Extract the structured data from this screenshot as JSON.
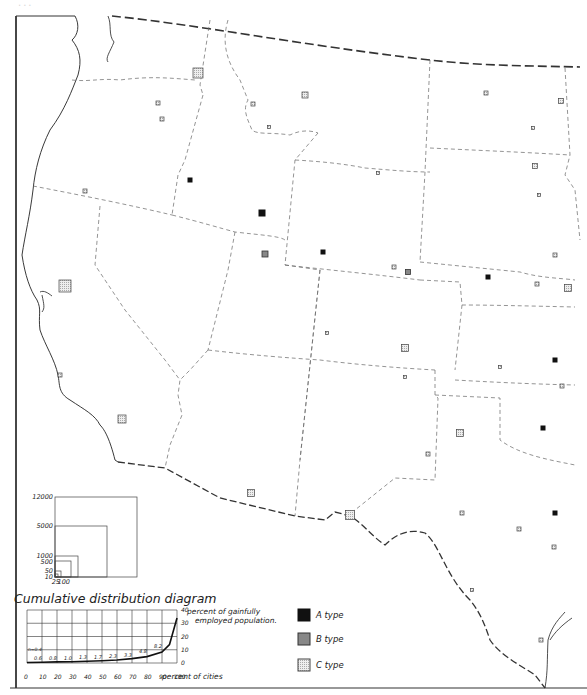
{
  "caption_partial": "...",
  "colors": {
    "ink": "#222222",
    "a_type": "#111111",
    "b_type": "#777777",
    "c_type": "#d9d9d9",
    "paper": "#ffffff"
  },
  "legend": {
    "items": [
      {
        "label": "A type",
        "fill": "#111111"
      },
      {
        "label": "B type",
        "fill": "#888888"
      },
      {
        "label": "C type",
        "fill": "#dcdcdc"
      }
    ]
  },
  "size_scale": {
    "labels_left": [
      "12000",
      "5000",
      "1000",
      "500",
      "50",
      "10"
    ],
    "labels_bottom": [
      "25",
      "100"
    ]
  },
  "chart_data": {
    "type": "line",
    "title": "Cumulative distribution diagram",
    "xlabel": "percent of cities",
    "ylabel": "percent of gainfully employed population.",
    "x_ticks": [
      "0",
      "10",
      "20",
      "30",
      "40",
      "50",
      "60",
      "70",
      "80",
      "90",
      "100"
    ],
    "y_ticks": [
      "0",
      "10",
      "20",
      "30",
      "40"
    ],
    "xlim": [
      0,
      100
    ],
    "ylim": [
      0,
      40
    ],
    "grid": true,
    "annotation": "n=0.4",
    "x": [
      0,
      10,
      20,
      30,
      40,
      50,
      60,
      70,
      80,
      90,
      95,
      100
    ],
    "values": [
      0.4,
      0.6,
      0.8,
      1.0,
      1.3,
      1.7,
      2.3,
      3.3,
      4.8,
      8.2,
      14,
      34
    ],
    "segment_labels": [
      "0.6",
      "0.8",
      "1.0",
      "1.3",
      "1.7",
      "2.3",
      "3.3",
      "4.8",
      "8.2"
    ]
  },
  "markers": [
    {
      "x": 198,
      "y": 73,
      "s": 10,
      "type": "C"
    },
    {
      "x": 158,
      "y": 103,
      "s": 4,
      "type": "C"
    },
    {
      "x": 162,
      "y": 119,
      "s": 4,
      "type": "C"
    },
    {
      "x": 253,
      "y": 104,
      "s": 4,
      "type": "C"
    },
    {
      "x": 269,
      "y": 127,
      "s": 3,
      "type": "C"
    },
    {
      "x": 305,
      "y": 95,
      "s": 6,
      "type": "C"
    },
    {
      "x": 486,
      "y": 93,
      "s": 4,
      "type": "C"
    },
    {
      "x": 561,
      "y": 101,
      "s": 5,
      "type": "C"
    },
    {
      "x": 533,
      "y": 128,
      "s": 3,
      "type": "C"
    },
    {
      "x": 85,
      "y": 191,
      "s": 4,
      "type": "C"
    },
    {
      "x": 190,
      "y": 180,
      "s": 4,
      "type": "A"
    },
    {
      "x": 378,
      "y": 173,
      "s": 3,
      "type": "C"
    },
    {
      "x": 535,
      "y": 166,
      "s": 5,
      "type": "C"
    },
    {
      "x": 539,
      "y": 195,
      "s": 3,
      "type": "C"
    },
    {
      "x": 262,
      "y": 213,
      "s": 6,
      "type": "A"
    },
    {
      "x": 265,
      "y": 254,
      "s": 6,
      "type": "B"
    },
    {
      "x": 323,
      "y": 252,
      "s": 4,
      "type": "A"
    },
    {
      "x": 394,
      "y": 267,
      "s": 4,
      "type": "C"
    },
    {
      "x": 408,
      "y": 272,
      "s": 5,
      "type": "B"
    },
    {
      "x": 488,
      "y": 277,
      "s": 4,
      "type": "A"
    },
    {
      "x": 555,
      "y": 255,
      "s": 4,
      "type": "C"
    },
    {
      "x": 537,
      "y": 284,
      "s": 4,
      "type": "C"
    },
    {
      "x": 568,
      "y": 288,
      "s": 7,
      "type": "C"
    },
    {
      "x": 65,
      "y": 286,
      "s": 12,
      "type": "C"
    },
    {
      "x": 327,
      "y": 333,
      "s": 3,
      "type": "C"
    },
    {
      "x": 405,
      "y": 348,
      "s": 7,
      "type": "C"
    },
    {
      "x": 500,
      "y": 367,
      "s": 3,
      "type": "C"
    },
    {
      "x": 555,
      "y": 360,
      "s": 4,
      "type": "A"
    },
    {
      "x": 405,
      "y": 377,
      "s": 3,
      "type": "C"
    },
    {
      "x": 562,
      "y": 386,
      "s": 4,
      "type": "C"
    },
    {
      "x": 60,
      "y": 375,
      "s": 4,
      "type": "C"
    },
    {
      "x": 122,
      "y": 419,
      "s": 8,
      "type": "C"
    },
    {
      "x": 460,
      "y": 433,
      "s": 7,
      "type": "C"
    },
    {
      "x": 428,
      "y": 454,
      "s": 4,
      "type": "C"
    },
    {
      "x": 543,
      "y": 428,
      "s": 4,
      "type": "A"
    },
    {
      "x": 251,
      "y": 493,
      "s": 7,
      "type": "C"
    },
    {
      "x": 350,
      "y": 515,
      "s": 9,
      "type": "C"
    },
    {
      "x": 462,
      "y": 513,
      "s": 4,
      "type": "C"
    },
    {
      "x": 555,
      "y": 513,
      "s": 4,
      "type": "A"
    },
    {
      "x": 519,
      "y": 529,
      "s": 4,
      "type": "C"
    },
    {
      "x": 554,
      "y": 547,
      "s": 4,
      "type": "C"
    },
    {
      "x": 472,
      "y": 590,
      "s": 3,
      "type": "C"
    },
    {
      "x": 541,
      "y": 640,
      "s": 4,
      "type": "C"
    }
  ]
}
